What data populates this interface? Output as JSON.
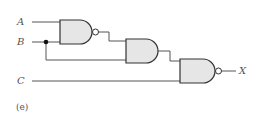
{
  "diagram": {
    "inputs": {
      "a": "A",
      "b": "B",
      "c": "C"
    },
    "output": "X",
    "caption": "(e)",
    "gates": [
      {
        "id": "g1",
        "type": "NAND",
        "inputs": [
          "A",
          "B"
        ]
      },
      {
        "id": "g2",
        "type": "AND",
        "inputs": [
          "g1",
          "B"
        ]
      },
      {
        "id": "g3",
        "type": "NAND",
        "inputs": [
          "g2",
          "C"
        ],
        "output": "X"
      }
    ],
    "colors": {
      "gate_fill": "#e6e6e6",
      "line": "#444444",
      "text": "#555555"
    }
  }
}
